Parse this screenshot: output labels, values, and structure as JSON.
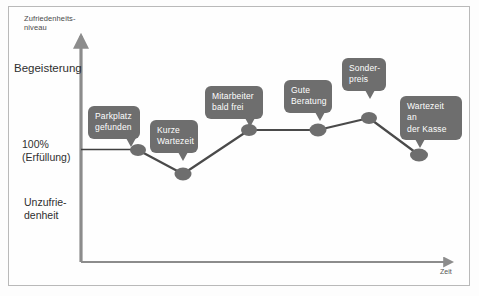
{
  "figure": {
    "frame_color": "#b9b9b9",
    "background": "#fefefe"
  },
  "axes": {
    "y_title": "Zufriedenheits-\nniveau",
    "y_top_label": "Begeisterung",
    "y_mid_label": "100%\n(Erfüllung)",
    "y_bottom_label": "Unzufrie-\ndenheit",
    "x_title": "Zeit",
    "axis_color": "#8c8c8c",
    "reference_line_color": "#4a4a4a"
  },
  "chart_data": {
    "type": "line",
    "xlabel": "Zeit",
    "ylabel": "Zufriedenheitsniveau",
    "ylim": [
      0,
      3
    ],
    "xlim": [
      0,
      6
    ],
    "grid": false,
    "legend": "none",
    "series_color": "#4a4a4a",
    "marker_color": "#6e6e6e",
    "reference": {
      "label": "100% (Erfüllung)",
      "y": 1.0,
      "type": "horizontal-line"
    },
    "y_category_labels": [
      "Unzufriedenheit",
      "100% (Erfüllung)",
      "Begeisterung"
    ],
    "series": [
      {
        "name": "Kundenerlebnis",
        "points": [
          {
            "label": "Parkplatz\ngefunden",
            "x": 1.0,
            "y": 1.0,
            "px": 138,
            "py": 150
          },
          {
            "label": "Kurze\nWartezeit",
            "x": 1.8,
            "y": 0.82,
            "px": 183,
            "py": 174
          },
          {
            "label": "Mitarbeiter\nbald frei",
            "x": 3.0,
            "y": 1.35,
            "px": 249,
            "py": 130
          },
          {
            "label": "Gute\nBeratung",
            "x": 4.2,
            "y": 1.35,
            "px": 318,
            "py": 130
          },
          {
            "label": "Sonder-\npreis",
            "x": 5.1,
            "y": 1.45,
            "px": 369,
            "py": 118
          },
          {
            "label": "Wartezeit an\nder Kasse",
            "x": 6.0,
            "y": 0.97,
            "px": 419,
            "py": 155
          }
        ]
      }
    ]
  },
  "callouts": [
    {
      "name": "parkplatz",
      "text": "Parkplatz\ngefunden",
      "left": 88,
      "top": 106,
      "width": 52,
      "tail_left": 38
    },
    {
      "name": "wartezeit",
      "text": "Kurze\nWartezeit",
      "left": 150,
      "top": 120,
      "width": 48,
      "tail_left": 28
    },
    {
      "name": "mitarbeiter",
      "text": "Mitarbeiter\nbald frei",
      "left": 205,
      "top": 86,
      "width": 58,
      "tail_left": 40
    },
    {
      "name": "beratung",
      "text": "Gute\nBeratung",
      "left": 284,
      "top": 80,
      "width": 48,
      "tail_left": 31
    },
    {
      "name": "sonderpreis",
      "text": "Sonder-\npreis",
      "left": 342,
      "top": 58,
      "width": 44,
      "tail_left": 23
    },
    {
      "name": "kasse",
      "text": "Wartezeit an\nder Kasse",
      "left": 400,
      "top": 96,
      "width": 62,
      "tail_left": 15
    }
  ]
}
